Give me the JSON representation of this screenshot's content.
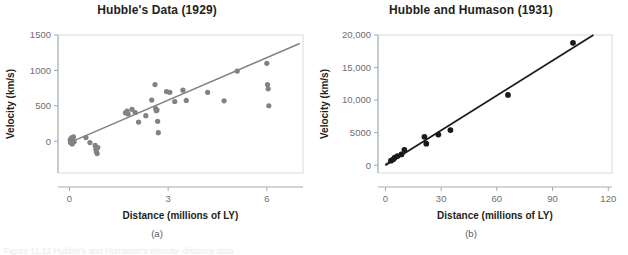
{
  "figure": {
    "sublabel_a": "(a)",
    "sublabel_b": "(b)",
    "clipped_caption": "Figure 11.12  Hubble's and Humason's velocity–distance data"
  },
  "chart_data": [
    {
      "type": "scatter",
      "panel": "a",
      "title": "Hubble's Data (1929)",
      "xlabel": "Distance (millions of LY)",
      "ylabel": "Velocity (km/s)",
      "xlim": [
        -0.35,
        7.1
      ],
      "ylim": [
        -450,
        1500
      ],
      "xticks": [
        0,
        3,
        6
      ],
      "xtick_labels": [
        "0",
        "3",
        "6"
      ],
      "yticks": [
        0,
        500,
        1000,
        1500
      ],
      "ytick_labels": [
        "0",
        "500",
        "1000",
        "1500"
      ],
      "grid": false,
      "marker_color": "#808284",
      "line_color": "#808284",
      "fit_line": {
        "x0": 0.0,
        "y0": -20,
        "x1": 7.0,
        "y1": 1380
      },
      "points": [
        {
          "x": 0.02,
          "y": 20
        },
        {
          "x": 0.03,
          "y": -20
        },
        {
          "x": 0.05,
          "y": 0
        },
        {
          "x": 0.06,
          "y": 45
        },
        {
          "x": 0.08,
          "y": -40
        },
        {
          "x": 0.1,
          "y": 10
        },
        {
          "x": 0.12,
          "y": 60
        },
        {
          "x": 0.14,
          "y": -10
        },
        {
          "x": 0.5,
          "y": 50
        },
        {
          "x": 0.62,
          "y": -20
        },
        {
          "x": 0.78,
          "y": -60
        },
        {
          "x": 0.8,
          "y": -110
        },
        {
          "x": 0.82,
          "y": -150
        },
        {
          "x": 0.84,
          "y": -175
        },
        {
          "x": 0.86,
          "y": -90
        },
        {
          "x": 1.7,
          "y": 400
        },
        {
          "x": 1.75,
          "y": 425
        },
        {
          "x": 1.78,
          "y": 385
        },
        {
          "x": 1.9,
          "y": 450
        },
        {
          "x": 2.0,
          "y": 405
        },
        {
          "x": 2.1,
          "y": 270
        },
        {
          "x": 2.32,
          "y": 360
        },
        {
          "x": 2.5,
          "y": 580
        },
        {
          "x": 2.6,
          "y": 800
        },
        {
          "x": 2.62,
          "y": 460
        },
        {
          "x": 2.64,
          "y": 430
        },
        {
          "x": 2.66,
          "y": 440
        },
        {
          "x": 2.68,
          "y": 280
        },
        {
          "x": 2.7,
          "y": 120
        },
        {
          "x": 2.95,
          "y": 700
        },
        {
          "x": 3.05,
          "y": 690
        },
        {
          "x": 3.2,
          "y": 560
        },
        {
          "x": 3.45,
          "y": 720
        },
        {
          "x": 3.55,
          "y": 575
        },
        {
          "x": 4.2,
          "y": 690
        },
        {
          "x": 4.7,
          "y": 570
        },
        {
          "x": 5.1,
          "y": 990
        },
        {
          "x": 6.0,
          "y": 1100
        },
        {
          "x": 6.02,
          "y": 800
        },
        {
          "x": 6.04,
          "y": 740
        },
        {
          "x": 6.06,
          "y": 500
        }
      ]
    },
    {
      "type": "scatter",
      "panel": "b",
      "title": "Hubble and Humason (1931)",
      "xlabel": "Distance (millions of LY)",
      "ylabel": "Velocity (km/s)",
      "xlim": [
        -4,
        122
      ],
      "ylim": [
        -1200,
        20000
      ],
      "xticks": [
        0,
        30,
        60,
        90,
        120
      ],
      "xtick_labels": [
        "0",
        "30",
        "60",
        "90",
        "120"
      ],
      "yticks": [
        0,
        5000,
        10000,
        15000,
        20000
      ],
      "ytick_labels": [
        "0",
        "5000",
        "10,000",
        "15,000",
        "20,000"
      ],
      "grid": false,
      "marker_color": "#1a1a1a",
      "line_color": "#1a1a1a",
      "fit_line": {
        "x0": 0.0,
        "y0": 0,
        "x1": 112.0,
        "y1": 20000
      },
      "inset_line_color": "#a7a9ac",
      "inset_line": {
        "x0": 0.0,
        "y0": 0,
        "x1": 7.0,
        "y1": 1380
      },
      "points": [
        {
          "x": 3.0,
          "y": 700
        },
        {
          "x": 4.2,
          "y": 900
        },
        {
          "x": 5.0,
          "y": 1150
        },
        {
          "x": 6.5,
          "y": 1400
        },
        {
          "x": 8.6,
          "y": 1650
        },
        {
          "x": 10.2,
          "y": 2350
        },
        {
          "x": 21.0,
          "y": 4350
        },
        {
          "x": 22.0,
          "y": 3300
        },
        {
          "x": 28.5,
          "y": 4700
        },
        {
          "x": 35.0,
          "y": 5400
        },
        {
          "x": 66.0,
          "y": 10800
        },
        {
          "x": 101.0,
          "y": 18800
        }
      ],
      "inset_points": [
        {
          "x": 0.4,
          "y": 150
        },
        {
          "x": 0.8,
          "y": 300
        },
        {
          "x": 1.6,
          "y": 420
        },
        {
          "x": 2.4,
          "y": 500
        },
        {
          "x": 2.7,
          "y": 560
        }
      ]
    }
  ]
}
